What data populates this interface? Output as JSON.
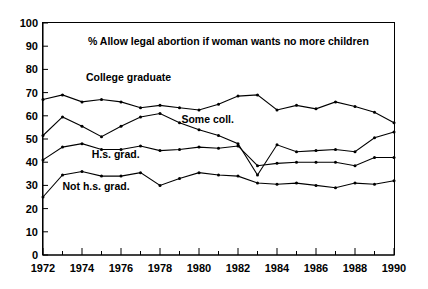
{
  "chart_data": {
    "type": "line",
    "title": "% Allow legal abortion if woman wants no more children",
    "xlabel": "",
    "ylabel": "",
    "xlim": [
      1972,
      1990
    ],
    "ylim": [
      0,
      100
    ],
    "grid": false,
    "legend_position": "inline-labels",
    "y_ticks": [
      0,
      10,
      20,
      30,
      40,
      50,
      60,
      70,
      80,
      90,
      100
    ],
    "y_tick_labels": [
      "0",
      "10",
      "20",
      "30",
      "40",
      "50",
      "60",
      "70",
      "80",
      "90",
      "100"
    ],
    "x_ticks": [
      1972,
      1973,
      1974,
      1975,
      1976,
      1977,
      1978,
      1979,
      1980,
      1981,
      1982,
      1983,
      1984,
      1985,
      1986,
      1987,
      1988,
      1989,
      1990
    ],
    "x_tick_labels": [
      "1972",
      "1974",
      "1976",
      "1978",
      "1980",
      "1982",
      "1984",
      "1986",
      "1988",
      "1990"
    ],
    "x_labeled_ticks": [
      1972,
      1974,
      1976,
      1978,
      1980,
      1982,
      1984,
      1986,
      1988,
      1990
    ],
    "x": [
      1972,
      1973,
      1974,
      1975,
      1976,
      1977,
      1978,
      1979,
      1980,
      1981,
      1982,
      1983,
      1984,
      1985,
      1986,
      1987,
      1988,
      1989,
      1990
    ],
    "series": [
      {
        "name": "College graduate",
        "label": "College graduate",
        "label_x": 1974.2,
        "label_y": 75,
        "values": [
          67,
          69,
          66,
          67,
          66,
          63.5,
          64.5,
          63.5,
          62.5,
          65,
          68.5,
          69,
          62.5,
          64.5,
          63,
          66,
          64,
          61.5,
          57
        ]
      },
      {
        "name": "Some coll.",
        "label": "Some coll.",
        "label_x": 1979.1,
        "label_y": 57,
        "values": [
          51.5,
          59.5,
          55.5,
          51,
          55.5,
          59.5,
          61,
          57,
          54,
          51.5,
          48,
          34.5,
          47.5,
          44.5,
          45,
          45.5,
          44.5,
          50.5,
          53
        ]
      },
      {
        "name": "H.s. grad.",
        "label": "H.s. grad.",
        "label_x": 1974.5,
        "label_y": 42,
        "values": [
          41,
          46.5,
          48,
          45.5,
          45.5,
          47,
          45,
          45.5,
          46.5,
          46,
          47,
          38.5,
          39.5,
          40,
          40,
          40,
          38.5,
          42,
          42
        ]
      },
      {
        "name": "Not h.s. grad.",
        "label": "Not h.s. grad.",
        "label_x": 1973.0,
        "label_y": 28,
        "values": [
          25,
          34.5,
          36,
          34,
          34,
          35.5,
          30,
          33,
          35.5,
          34.5,
          34,
          31,
          30.5,
          31,
          30,
          29,
          31,
          30.5,
          32
        ]
      }
    ]
  }
}
